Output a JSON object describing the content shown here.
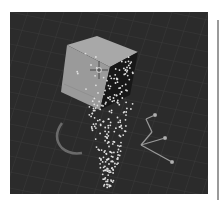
{
  "app": {
    "view": "3D Viewport",
    "scene": {
      "objects": [
        {
          "name": "cube",
          "type": "mesh"
        },
        {
          "name": "particle-system",
          "type": "particles"
        },
        {
          "name": "force-field-vortex",
          "type": "force-field"
        },
        {
          "name": "empty-axes",
          "type": "empty"
        }
      ],
      "cursor": "3d-cursor"
    },
    "colors": {
      "viewport_bg": "#2b2b2b",
      "grid": "#3a3a3a",
      "cube_light_face": "#9c9c9c",
      "cube_top_face": "#a8a8a8",
      "cube_dark_face": "#1a1a1a",
      "particle": "#e0e0e0",
      "vortex": "#6a6a6a",
      "empty": "#9a9a9a"
    }
  }
}
